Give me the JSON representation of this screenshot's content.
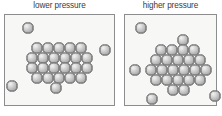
{
  "figure": {
    "background_color": "#ffffff",
    "width": 222,
    "height": 116,
    "particle_color": "#c6c6c6",
    "particle_outline_color": "#7b7b7b",
    "panel_fill_color": "#f7f7f5",
    "panel_border_color": "#8d8d8d",
    "label_color": "#3b3b3b"
  },
  "panels": [
    {
      "id": "lower-pressure",
      "label": "lower pressure",
      "box": {
        "x": 4,
        "y": 14,
        "width": 111,
        "height": 92
      },
      "particle_radius": 5.6,
      "cluster_particles": [
        {
          "x": 37,
          "y": 48
        },
        {
          "x": 48,
          "y": 48
        },
        {
          "x": 59,
          "y": 48
        },
        {
          "x": 70,
          "y": 48
        },
        {
          "x": 81,
          "y": 48
        },
        {
          "x": 32,
          "y": 58
        },
        {
          "x": 43,
          "y": 58
        },
        {
          "x": 54,
          "y": 58
        },
        {
          "x": 65,
          "y": 58
        },
        {
          "x": 76,
          "y": 58
        },
        {
          "x": 87,
          "y": 58
        },
        {
          "x": 32,
          "y": 68
        },
        {
          "x": 43,
          "y": 68
        },
        {
          "x": 54,
          "y": 68
        },
        {
          "x": 65,
          "y": 68
        },
        {
          "x": 76,
          "y": 68
        },
        {
          "x": 87,
          "y": 68
        },
        {
          "x": 37,
          "y": 78
        },
        {
          "x": 48,
          "y": 78
        },
        {
          "x": 59,
          "y": 78
        },
        {
          "x": 70,
          "y": 78
        },
        {
          "x": 81,
          "y": 78
        },
        {
          "x": 56,
          "y": 88
        }
      ],
      "free_particles": [
        {
          "x": 28,
          "y": 28
        },
        {
          "x": 12,
          "y": 86
        },
        {
          "x": 105,
          "y": 50
        }
      ]
    },
    {
      "id": "higher-pressure",
      "label": "higher pressure",
      "box": {
        "x": 124,
        "y": 14,
        "width": 93,
        "height": 92
      },
      "particle_radius": 5.6,
      "cluster_particles": [
        {
          "x": 183,
          "y": 40
        },
        {
          "x": 161,
          "y": 50
        },
        {
          "x": 172,
          "y": 50
        },
        {
          "x": 183,
          "y": 50
        },
        {
          "x": 194,
          "y": 50
        },
        {
          "x": 156,
          "y": 60
        },
        {
          "x": 167,
          "y": 60
        },
        {
          "x": 178,
          "y": 60
        },
        {
          "x": 189,
          "y": 60
        },
        {
          "x": 200,
          "y": 60
        },
        {
          "x": 151,
          "y": 70
        },
        {
          "x": 162,
          "y": 70
        },
        {
          "x": 173,
          "y": 70
        },
        {
          "x": 184,
          "y": 70
        },
        {
          "x": 195,
          "y": 70
        },
        {
          "x": 206,
          "y": 70
        },
        {
          "x": 156,
          "y": 80
        },
        {
          "x": 167,
          "y": 80
        },
        {
          "x": 178,
          "y": 80
        },
        {
          "x": 189,
          "y": 80
        },
        {
          "x": 200,
          "y": 80
        },
        {
          "x": 173,
          "y": 90
        },
        {
          "x": 184,
          "y": 90
        }
      ],
      "free_particles": [
        {
          "x": 141,
          "y": 28
        },
        {
          "x": 135,
          "y": 70
        },
        {
          "x": 152,
          "y": 99
        },
        {
          "x": 215,
          "y": 96
        }
      ]
    }
  ]
}
